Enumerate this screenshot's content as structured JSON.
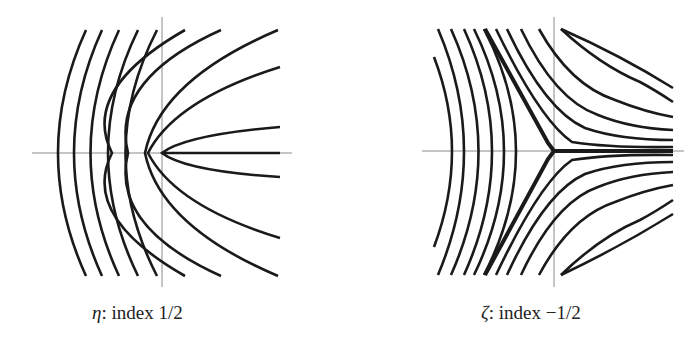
{
  "figures": [
    {
      "id": "eta",
      "symbol": "η",
      "caption_rest": ": index 1/2",
      "caption": "η: index 1/2",
      "description": "Line field singularity of index 1/2: nested parabola-like curves opening to the right around the origin"
    },
    {
      "id": "zeta",
      "symbol": "ζ",
      "caption_rest": ": index −1/2",
      "caption": "ζ: index −1/2",
      "description": "Line field singularity of index −1/2: three-pronged (trisector) pattern with hyperbola-like curves"
    }
  ],
  "colors": {
    "curve": "#1a1a1a",
    "axis": "#8a8a8a",
    "background": "#ffffff"
  }
}
